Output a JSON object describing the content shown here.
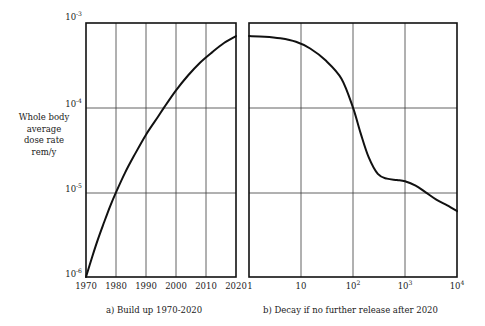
{
  "figure": {
    "y_axis_label_lines": [
      "Whole body",
      "average",
      "dose rate",
      "rem/y"
    ],
    "y_ticks": [
      {
        "label": "10",
        "exp": "-3",
        "value": 0.001
      },
      {
        "label": "10",
        "exp": "-4",
        "value": 0.0001
      },
      {
        "label": "10",
        "exp": "-5",
        "value": 1e-05
      },
      {
        "label": "10",
        "exp": "-6",
        "value": 1e-06
      }
    ],
    "panel_a": {
      "caption": "a)  Build up 1970-2020",
      "x_ticks": [
        "1970",
        "1980",
        "1990",
        "2000",
        "2010",
        "2020"
      ]
    },
    "panel_b": {
      "caption": "b)  Decay if no further release after 2020",
      "x_ticks": [
        {
          "label": "1",
          "exp": ""
        },
        {
          "label": "10",
          "exp": ""
        },
        {
          "label": "10",
          "exp": "2"
        },
        {
          "label": "10",
          "exp": "3"
        },
        {
          "label": "10",
          "exp": "4"
        }
      ]
    },
    "colors": {
      "curve": "#111111",
      "frame": "#111111",
      "grid": "#3a3a3a",
      "background": "#ffffff"
    }
  },
  "chart_data": [
    {
      "type": "line",
      "title": "a)  Build up 1970-2020",
      "xlabel": "",
      "ylabel": "Whole body average dose rate rem/y",
      "xscale": "linear",
      "yscale": "log",
      "xlim": [
        1970,
        2020
      ],
      "ylim": [
        1e-06,
        0.001
      ],
      "xticks": [
        1970,
        1980,
        1990,
        2000,
        2010,
        2020
      ],
      "yticks": [
        1e-06,
        1e-05,
        0.0001,
        0.001
      ],
      "grid": true,
      "legend": "none",
      "x": [
        1970,
        1972,
        1974,
        1976,
        1978,
        1980,
        1983,
        1986,
        1990,
        1994,
        1996,
        2000,
        2004,
        2008,
        2012,
        2016,
        2020
      ],
      "y": [
        1e-06,
        1.7e-06,
        2.8e-06,
        4.4e-06,
        6.8e-06,
        1e-05,
        1.7e-05,
        2.7e-05,
        4.8e-05,
        7.8e-05,
        0.0001,
        0.00016,
        0.00024,
        0.00034,
        0.00045,
        0.00058,
        0.0007
      ]
    },
    {
      "type": "line",
      "title": "b)  Decay if no further release after 2020",
      "xlabel": "",
      "ylabel": "Whole body average dose rate rem/y",
      "xscale": "log",
      "yscale": "log",
      "xlim": [
        1,
        10000
      ],
      "ylim": [
        1e-06,
        0.001
      ],
      "xticks": [
        1,
        10,
        100,
        1000,
        10000
      ],
      "yticks": [
        1e-06,
        1e-05,
        0.0001,
        0.001
      ],
      "grid": true,
      "legend": "none",
      "x": [
        1,
        2,
        4,
        8,
        15,
        30,
        60,
        100,
        140,
        200,
        300,
        450,
        700,
        1000,
        1600,
        2500,
        4000,
        6500,
        10000
      ],
      "y": [
        0.0007,
        0.00069,
        0.00066,
        0.0006,
        0.0005,
        0.00036,
        0.00022,
        0.0001,
        5e-05,
        2.6e-05,
        1.65e-05,
        1.45e-05,
        1.4e-05,
        1.35e-05,
        1.2e-05,
        1e-05,
        8.2e-05,
        7e-06,
        6e-06
      ],
      "y_corrected": [
        0.0007,
        0.00069,
        0.00066,
        0.0006,
        0.0005,
        0.00036,
        0.00022,
        0.0001,
        5e-05,
        2.6e-05,
        1.65e-05,
        1.45e-05,
        1.4e-05,
        1.35e-05,
        1.2e-05,
        1e-05,
        8.2e-06,
        7e-06,
        6e-06
      ],
      "annotations": [
        "plateau near 1.3e-5 between x=300 and x=1000"
      ]
    }
  ]
}
